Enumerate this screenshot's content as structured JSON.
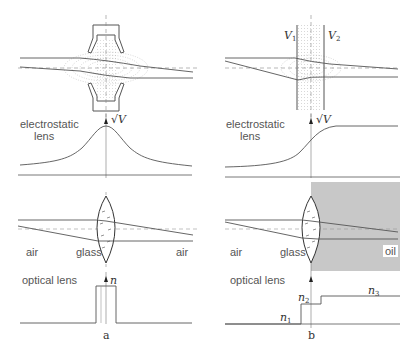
{
  "figure": {
    "panel_a": {
      "caption": "a",
      "electrostatic_label_line1": "electrostatic",
      "electrostatic_label_line2": "lens",
      "electrostatic_axis_label": "√V",
      "optical_label": "optical lens",
      "optical_axis_label": "n",
      "medium_left": "air",
      "medium_center": "glass",
      "medium_right": "air"
    },
    "panel_b": {
      "caption": "b",
      "electrode_left": "V",
      "electrode_left_sub": "1",
      "electrode_right": "V",
      "electrode_right_sub": "2",
      "electrostatic_label_line1": "electrostatic",
      "electrostatic_label_line2": "lens",
      "electrostatic_axis_label": "√V",
      "optical_label": "optical lens",
      "optical_axis_label": "n",
      "medium_left": "air",
      "medium_center": "glass",
      "medium_right": "oil",
      "index_1": "n",
      "index_1_sub": "1",
      "index_2": "n",
      "index_2_sub": "2",
      "index_3": "n",
      "index_3_sub": "3"
    },
    "colors": {
      "line": "#555555",
      "dotted": "#aaaaaa",
      "oil_fill": "#c8c8c8",
      "text": "#555555"
    }
  }
}
